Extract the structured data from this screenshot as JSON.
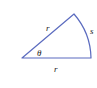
{
  "diagram": {
    "type": "circular-sector",
    "colors": {
      "stroke": "#5b6bbf",
      "label": "#222222",
      "background": "#ffffff"
    },
    "labels": {
      "radius_upper": "r",
      "radius_lower": "r",
      "arc": "s",
      "angle": "θ"
    }
  }
}
